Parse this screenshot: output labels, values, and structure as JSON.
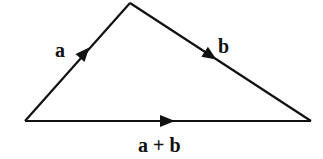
{
  "diagram": {
    "vertices": {
      "start": {
        "x": 25,
        "y": 121
      },
      "apex": {
        "x": 130,
        "y": 3
      },
      "end": {
        "x": 311,
        "y": 121
      }
    },
    "vectors": [
      {
        "id": "a",
        "label": "a",
        "from": "start",
        "to": "apex",
        "label_pos": {
          "x": 55,
          "y": 58
        }
      },
      {
        "id": "b",
        "label": "b",
        "from": "apex",
        "to": "end",
        "label_pos": {
          "x": 220,
          "y": 53
        }
      },
      {
        "id": "sum",
        "label": "a + b",
        "from": "start",
        "to": "end",
        "label_pos": {
          "x": 168,
          "y": 151
        }
      }
    ],
    "line_color": "#111111"
  }
}
